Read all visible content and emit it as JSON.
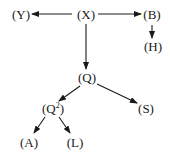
{
  "diagram": {
    "type": "tree",
    "nodes": [
      {
        "id": "X",
        "label": "(X)",
        "x": 86,
        "y": 15
      },
      {
        "id": "Y",
        "label": "(Y)",
        "x": 21,
        "y": 15
      },
      {
        "id": "B",
        "label": "(B)",
        "x": 152,
        "y": 15
      },
      {
        "id": "H",
        "label": "(H)",
        "x": 153,
        "y": 47
      },
      {
        "id": "Q",
        "label": "(Q)",
        "x": 87,
        "y": 78
      },
      {
        "id": "Q2",
        "label_base": "(Q",
        "label_sup": "2",
        "label_end": ")",
        "x": 53,
        "y": 109
      },
      {
        "id": "S",
        "label": "(S)",
        "x": 146,
        "y": 109
      },
      {
        "id": "A",
        "label": "(A)",
        "x": 29,
        "y": 143
      },
      {
        "id": "L",
        "label": "(L)",
        "x": 75,
        "y": 143
      }
    ],
    "edges": [
      {
        "from": "X",
        "to": "Y"
      },
      {
        "from": "X",
        "to": "B"
      },
      {
        "from": "B",
        "to": "H"
      },
      {
        "from": "X",
        "to": "Q"
      },
      {
        "from": "Q",
        "to": "Q2"
      },
      {
        "from": "Q",
        "to": "S"
      },
      {
        "from": "Q2",
        "to": "A"
      },
      {
        "from": "Q2",
        "to": "L"
      }
    ],
    "line_color": "#1a1a1a"
  }
}
